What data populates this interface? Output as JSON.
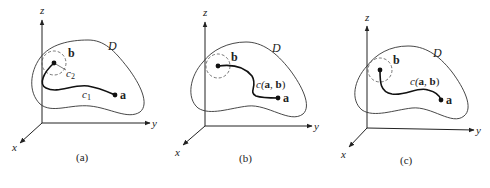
{
  "figure": {
    "panels": [
      {
        "id": "a",
        "caption": "(a)",
        "axes": {
          "x": "x",
          "y": "y",
          "z": "z"
        },
        "region_label": "D",
        "point_a": "a",
        "point_b": "b",
        "curve_labels": [
          "c",
          "c"
        ],
        "curve_subscripts": [
          "1",
          "2"
        ]
      },
      {
        "id": "b",
        "caption": "(b)",
        "axes": {
          "x": "x",
          "y": "y",
          "z": "z"
        },
        "region_label": "D",
        "point_a": "a",
        "point_b": "b",
        "curve_label_prefix": "c(",
        "curve_label_a": "a",
        "curve_label_sep": ", ",
        "curve_label_b": "b",
        "curve_label_suffix": ")"
      },
      {
        "id": "c",
        "caption": "(c)",
        "axes": {
          "x": "x",
          "y": "y",
          "z": "z"
        },
        "region_label": "D",
        "point_a": "a",
        "point_b": "b",
        "curve_label_prefix": "c(",
        "curve_label_a": "a",
        "curve_label_sep": ", ",
        "curve_label_b": "b",
        "curve_label_suffix": ")"
      }
    ],
    "colors": {
      "stroke": "#222222",
      "dashed": "#555555",
      "background": "#ffffff"
    }
  }
}
